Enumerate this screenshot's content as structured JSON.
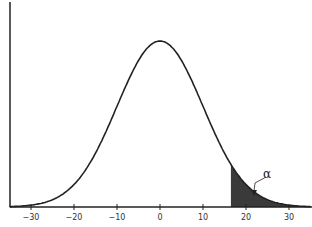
{
  "chart_data": {
    "type": "area",
    "title": "",
    "xlabel": "",
    "ylabel": "",
    "distribution": {
      "mean": 0,
      "std": 10
    },
    "xlim": [
      -35,
      35
    ],
    "x_ticks": [
      -30,
      -20,
      -10,
      0,
      10,
      20,
      30
    ],
    "x_tick_labels": [
      "−30",
      "−20",
      "−10",
      "0",
      "10",
      "20",
      "30"
    ],
    "shaded_region": {
      "from": 16.5,
      "to": 35,
      "color": "#333333"
    },
    "annotations": [
      {
        "text": "α",
        "points_to_x": 21.5
      }
    ],
    "grid": false,
    "legend": null
  },
  "colors": {
    "curve": "#222222",
    "shade": "#3a3a3a",
    "axis": "#222222"
  }
}
